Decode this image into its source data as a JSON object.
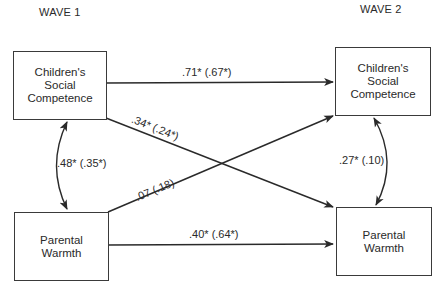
{
  "waves": {
    "wave1": "WAVE 1",
    "wave2": "WAVE 2"
  },
  "nodes": {
    "w1_social": {
      "lines": [
        "Children's",
        "Social",
        "Competence"
      ]
    },
    "w1_warmth": {
      "lines": [
        "Parental",
        "Warmth"
      ]
    },
    "w2_social": {
      "lines": [
        "Children's",
        "Social",
        "Competence"
      ]
    },
    "w2_warmth": {
      "lines": [
        "Parental",
        "Warmth"
      ]
    }
  },
  "edges": {
    "social_stability": ".71* (.67*)",
    "warmth_stability": ".40* (.64*)",
    "social_to_warmth": ".34* (.24*)",
    "warmth_to_social": ".07 (.18)",
    "w1_correlation": ".48* (.35*)",
    "w2_correlation": ".27* (.10)"
  },
  "colors": {
    "line": "#2a2a2a",
    "text": "#2a2a2a",
    "background": "#ffffff"
  }
}
